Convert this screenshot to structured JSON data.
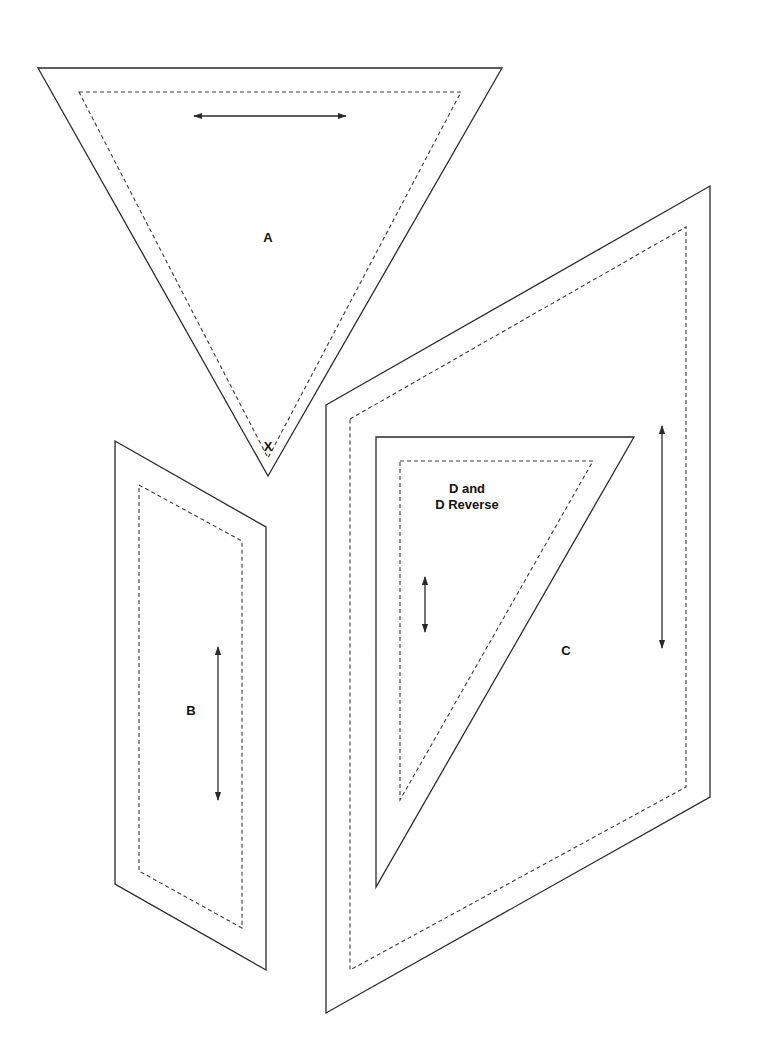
{
  "diagram": {
    "type": "quilt-pattern-templates",
    "colors": {
      "background": "#ffffff",
      "line": "#2a2a2a"
    },
    "pieces": [
      {
        "id": "A",
        "label": "A",
        "point_label": "X",
        "shape": "triangle",
        "outline": [
          [
            38,
            68
          ],
          [
            502,
            68
          ],
          [
            268,
            476
          ]
        ],
        "seam_line": [
          [
            79,
            92
          ],
          [
            461,
            92
          ],
          [
            268,
            458
          ]
        ],
        "grain_arrow": {
          "orientation": "horizontal",
          "from": [
            194,
            116
          ],
          "to": [
            346,
            116
          ]
        },
        "label_pos": [
          268,
          237
        ],
        "point_label_pos": [
          268,
          446
        ]
      },
      {
        "id": "B",
        "label": "B",
        "shape": "parallelogram",
        "outline": [
          [
            115,
            441
          ],
          [
            266,
            527
          ],
          [
            266,
            970
          ],
          [
            115,
            884
          ]
        ],
        "seam_line": [
          [
            139,
            485
          ],
          [
            242,
            541
          ],
          [
            242,
            928
          ],
          [
            139,
            871
          ]
        ],
        "grain_arrow": {
          "orientation": "vertical",
          "from": [
            218,
            647
          ],
          "to": [
            218,
            800
          ]
        },
        "label_pos": [
          191,
          710
        ]
      },
      {
        "id": "C",
        "label": "C",
        "shape": "parallelogram",
        "outline": [
          [
            326,
            405
          ],
          [
            710,
            186
          ],
          [
            710,
            797
          ],
          [
            326,
            1013
          ]
        ],
        "seam_line": [
          [
            350,
            419
          ],
          [
            686,
            227
          ],
          [
            686,
            787
          ],
          [
            350,
            970
          ]
        ],
        "grain_arrow": {
          "orientation": "vertical",
          "from": [
            662,
            426
          ],
          "to": [
            662,
            648
          ]
        },
        "label_pos": [
          566,
          650
        ]
      },
      {
        "id": "D",
        "label_line1": "D and",
        "label_line2": "D Reverse",
        "shape": "right-triangle",
        "outline": [
          [
            376,
            437
          ],
          [
            634,
            437
          ],
          [
            376,
            887
          ]
        ],
        "seam_line": [
          [
            400,
            461
          ],
          [
            593,
            461
          ],
          [
            400,
            800
          ]
        ],
        "grain_arrow": {
          "orientation": "vertical",
          "from": [
            425,
            577
          ],
          "to": [
            425,
            632
          ]
        },
        "label_pos": [
          467,
          493
        ]
      }
    ]
  }
}
